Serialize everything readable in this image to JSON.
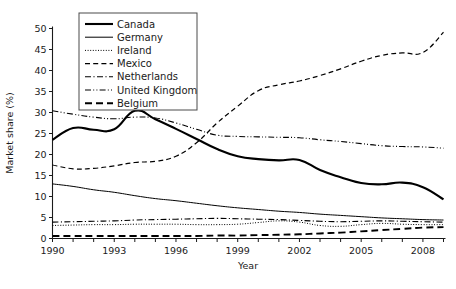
{
  "chart_data": {
    "type": "line",
    "title": "",
    "xlabel": "Year",
    "ylabel": "Market share (%)",
    "xlim": [
      1990,
      2009
    ],
    "ylim": [
      0,
      50
    ],
    "ytick_step": 5,
    "yticks": [
      0,
      5,
      10,
      15,
      20,
      25,
      30,
      35,
      40,
      45,
      50
    ],
    "xticks_all": [
      1990,
      1991,
      1992,
      1993,
      1994,
      1995,
      1996,
      1997,
      1998,
      1999,
      2000,
      2001,
      2002,
      2003,
      2004,
      2005,
      2006,
      2007,
      2008,
      2009
    ],
    "xtick_labels": [
      "1990",
      "1993",
      "1996",
      "1999",
      "2002",
      "2005",
      "2008"
    ],
    "xtick_label_years": [
      1990,
      1993,
      1996,
      1999,
      2002,
      2005,
      2008
    ],
    "grid": false,
    "legend_position": "top-left-inside",
    "x": [
      1990,
      1991,
      1992,
      1993,
      1994,
      1995,
      1996,
      1997,
      1998,
      1999,
      2000,
      2001,
      2002,
      2003,
      2004,
      2005,
      2006,
      2007,
      2008,
      2009
    ],
    "series": [
      {
        "name": "Canada",
        "style": "solid-thick",
        "values": [
          23.5,
          26.3,
          25.9,
          26.0,
          30.4,
          28.4,
          26.1,
          23.7,
          21.3,
          19.6,
          18.9,
          18.6,
          18.7,
          16.3,
          14.6,
          13.2,
          12.9,
          13.3,
          12.2,
          9.3
        ]
      },
      {
        "name": "Germany",
        "style": "solid-thin",
        "values": [
          13.0,
          12.4,
          11.6,
          11.0,
          10.2,
          9.5,
          9.0,
          8.4,
          7.8,
          7.3,
          6.9,
          6.5,
          6.2,
          5.8,
          5.5,
          5.2,
          4.9,
          4.7,
          4.5,
          4.4
        ]
      },
      {
        "name": "Ireland",
        "style": "dotted",
        "values": [
          3.1,
          3.2,
          3.3,
          3.3,
          3.4,
          3.4,
          3.4,
          3.3,
          3.3,
          3.4,
          3.8,
          4.2,
          3.9,
          3.1,
          2.9,
          3.3,
          3.6,
          3.4,
          3.3,
          3.3
        ]
      },
      {
        "name": "Mexico",
        "style": "dashed",
        "values": [
          17.5,
          16.6,
          16.7,
          17.3,
          18.1,
          18.4,
          19.6,
          22.8,
          27.5,
          31.5,
          35.2,
          36.6,
          37.5,
          38.8,
          40.4,
          42.2,
          43.6,
          44.2,
          44.3,
          49.1
        ]
      },
      {
        "name": "Netherlands",
        "style": "dash-dot",
        "values": [
          3.9,
          4.0,
          4.1,
          4.2,
          4.4,
          4.5,
          4.6,
          4.7,
          4.8,
          4.7,
          4.6,
          4.5,
          4.3,
          4.1,
          4.0,
          4.1,
          4.2,
          4.1,
          4.0,
          3.9
        ]
      },
      {
        "name": "United Kingdom",
        "style": "dash-dot-dot",
        "values": [
          30.4,
          29.6,
          28.9,
          28.5,
          28.9,
          28.7,
          27.5,
          26.0,
          24.6,
          24.3,
          24.2,
          24.1,
          24.0,
          23.5,
          23.1,
          22.6,
          22.1,
          21.9,
          21.8,
          21.5
        ]
      },
      {
        "name": "Belgium",
        "style": "long-dash",
        "values": [
          0.6,
          0.6,
          0.6,
          0.6,
          0.6,
          0.6,
          0.6,
          0.6,
          0.7,
          0.7,
          0.8,
          0.9,
          1.0,
          1.2,
          1.4,
          1.7,
          2.0,
          2.3,
          2.6,
          2.7
        ]
      }
    ]
  },
  "legend": {
    "entries": [
      {
        "label": "Canada"
      },
      {
        "label": "Germany"
      },
      {
        "label": "Ireland"
      },
      {
        "label": "Mexico"
      },
      {
        "label": "Netherlands"
      },
      {
        "label": "United Kingdom"
      },
      {
        "label": "Belgium"
      }
    ]
  },
  "colors": {
    "line": "#000000",
    "axis": "#1a1a1a",
    "background": "#ffffff",
    "legend_border": "#4a4a4a"
  }
}
